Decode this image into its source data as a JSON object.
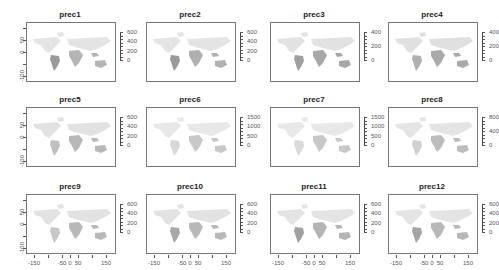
{
  "chart_data": {
    "type": "heatmap",
    "layout": {
      "rows": 3,
      "cols": 4
    },
    "x_axis": {
      "label": "",
      "ticks": [
        -150,
        -50,
        0,
        50,
        150
      ],
      "shown_on_row": 3
    },
    "y_axis": {
      "label": "",
      "ticks": [
        50,
        0,
        -100
      ],
      "minor_ticks": [
        100,
        50,
        0,
        -50,
        -100
      ],
      "shown_on_col": 1
    },
    "colormap": "grayscale (light gray = low, dark gray = high)",
    "panels": [
      {
        "title": "prec1",
        "legend_ticks": [
          0,
          200,
          400,
          600
        ]
      },
      {
        "title": "prec2",
        "legend_ticks": [
          0,
          200,
          400,
          600
        ]
      },
      {
        "title": "prec3",
        "legend_ticks": [
          0,
          200,
          400
        ]
      },
      {
        "title": "prec4",
        "legend_ticks": [
          0,
          200,
          400
        ]
      },
      {
        "title": "prec5",
        "legend_ticks": [
          0,
          200,
          400,
          600
        ]
      },
      {
        "title": "prec6",
        "legend_ticks": [
          0,
          500,
          1000,
          1500
        ]
      },
      {
        "title": "prec7",
        "legend_ticks": [
          0,
          500,
          1000,
          1500
        ]
      },
      {
        "title": "prec8",
        "legend_ticks": [
          0,
          400,
          800
        ]
      },
      {
        "title": "prec9",
        "legend_ticks": [
          0,
          200,
          400,
          600
        ]
      },
      {
        "title": "prec10",
        "legend_ticks": [
          0,
          200,
          400,
          600
        ]
      },
      {
        "title": "prec11",
        "legend_ticks": [
          0,
          200,
          400,
          600
        ]
      },
      {
        "title": "prec12",
        "legend_ticks": [
          0,
          200,
          400,
          600
        ]
      }
    ]
  },
  "panels": [
    {
      "title": "prec1",
      "legend": [
        "600",
        "400",
        "200",
        "0"
      ]
    },
    {
      "title": "prec2",
      "legend": [
        "600",
        "400",
        "200",
        "0"
      ]
    },
    {
      "title": "prec3",
      "legend": [
        "400",
        "200",
        "0"
      ]
    },
    {
      "title": "prec4",
      "legend": [
        "400",
        "200",
        "0"
      ]
    },
    {
      "title": "prec5",
      "legend": [
        "600",
        "400",
        "200",
        "0"
      ]
    },
    {
      "title": "prec6",
      "legend": [
        "1500",
        "1000",
        "500",
        "0"
      ]
    },
    {
      "title": "prec7",
      "legend": [
        "1500",
        "1000",
        "500",
        "0"
      ]
    },
    {
      "title": "prec8",
      "legend": [
        "800",
        "400",
        "0"
      ]
    },
    {
      "title": "prec9",
      "legend": [
        "600",
        "400",
        "200",
        "0"
      ]
    },
    {
      "title": "prec10",
      "legend": [
        "600",
        "400",
        "200",
        "0"
      ]
    },
    {
      "title": "prec11",
      "legend": [
        "600",
        "400",
        "200",
        "0"
      ]
    },
    {
      "title": "prec12",
      "legend": [
        "600",
        "400",
        "200",
        "0"
      ]
    }
  ],
  "axes": {
    "y_labels": [
      "50",
      "0",
      "-100"
    ],
    "x_labels": [
      "-150",
      "-50",
      "0",
      "50",
      "150"
    ]
  }
}
